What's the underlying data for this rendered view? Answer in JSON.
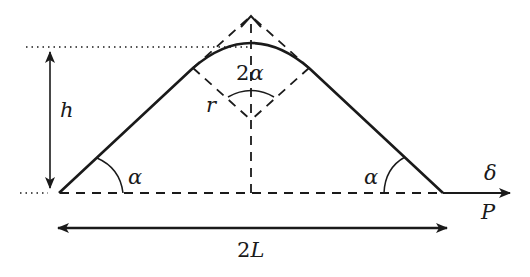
{
  "figure": {
    "type": "geometry-diagram",
    "colors": {
      "stroke": "#1a1a1a",
      "background": "#ffffff"
    }
  },
  "labels": {
    "height": "h",
    "apex_angle_num": "2",
    "apex_angle_sym": "α",
    "radius": "r",
    "left_angle": "α",
    "right_angle": "α",
    "displacement": "δ",
    "load": "P",
    "span_num": "2",
    "span_sym": "L"
  }
}
